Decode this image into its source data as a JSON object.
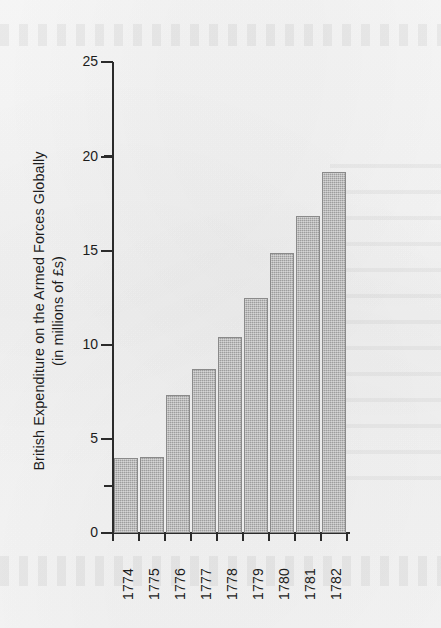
{
  "chart_data": {
    "type": "bar",
    "title": "",
    "xlabel": "",
    "ylabel": "British Expenditure on the Armed Forces Globally\n(in millions of £s)",
    "categories": [
      "1774",
      "1775",
      "1776",
      "1777",
      "1778",
      "1779",
      "1780",
      "1781",
      "1782"
    ],
    "values": [
      4.0,
      4.05,
      7.3,
      8.7,
      10.4,
      12.5,
      14.85,
      16.85,
      19.15
    ],
    "ylim": [
      0,
      25
    ],
    "ytick_labels": [
      "0",
      "5",
      "10",
      "15",
      "20",
      "25"
    ],
    "ytick_values": [
      0,
      5,
      10,
      15,
      20,
      25
    ],
    "yminor_tick_values": [
      2.5,
      7.5,
      12.5,
      17.5,
      22.5
    ],
    "grid": false,
    "legend": "none",
    "bar_color": "#9d9d9d",
    "axis_color": "#2b2b2b",
    "background_color": "#f6f6f6"
  },
  "axis": {
    "y_title_line1": "British Expenditure on the Armed Forces Globally",
    "y_title_line2": "(in millions of £s)",
    "y_labels": {
      "t0": "0",
      "t5": "5",
      "t10": "10",
      "t15": "15",
      "t20": "20",
      "t25": "25"
    }
  },
  "x_labels": {
    "b0": "1774",
    "b1": "1775",
    "b2": "1776",
    "b3": "1777",
    "b4": "1778",
    "b5": "1779",
    "b6": "1780",
    "b7": "1781",
    "b8": "1782"
  }
}
